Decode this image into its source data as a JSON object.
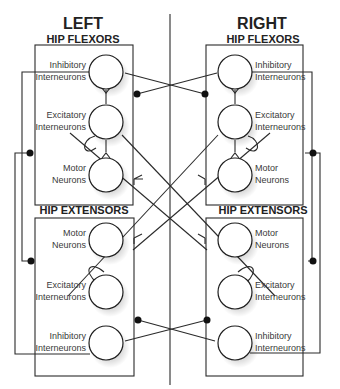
{
  "diagram": {
    "sides": [
      {
        "id": "left",
        "title": "LEFT"
      },
      {
        "id": "right",
        "title": "RIGHT"
      }
    ],
    "groups": {
      "flexors": "HIP FLEXORS",
      "extensors": "HIP EXTENSORS"
    },
    "neurons": {
      "inhibitory": [
        "Inhibitory",
        "Interneurons"
      ],
      "excitatory": [
        "Excitatory",
        "Interneurons"
      ],
      "motor": [
        "Motor",
        "Neurons"
      ]
    },
    "legend": {
      "inhibitory_synapse": "filled-dot",
      "excitatory_synapse": "fork-terminal"
    },
    "colors": {
      "line": "#2a2a2a",
      "cell_fill": "#ffffff",
      "synapse_dot": "#111111"
    }
  }
}
